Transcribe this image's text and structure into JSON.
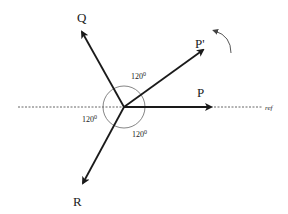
{
  "diagram": {
    "type": "phasor",
    "colors": {
      "stroke": "#1a1a1a",
      "circle": "#666666",
      "dashed": "#555555",
      "background": "#ffffff"
    },
    "center": {
      "x": 124,
      "y": 107
    },
    "reference_line": {
      "label": "ref"
    },
    "phasors": [
      {
        "id": "P",
        "label": "P"
      },
      {
        "id": "P_prime",
        "label": "P'"
      },
      {
        "id": "Q",
        "label": "Q"
      },
      {
        "id": "R",
        "label": "R"
      }
    ],
    "angles": [
      {
        "label": "120",
        "sup": "0"
      },
      {
        "label": "120",
        "sup": "0"
      },
      {
        "label": "120",
        "sup": "0"
      }
    ],
    "rotation_arrow": {
      "direction": "counter-clockwise"
    }
  }
}
